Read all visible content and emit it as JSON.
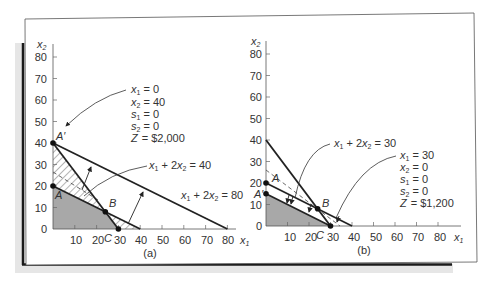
{
  "figure": {
    "colors": {
      "background": "#ffffff",
      "frame": "#555555",
      "shadow_dark": "#1a1a1a",
      "shadow_light": "#e6e6e6",
      "feasible_fill": "#a8a8a8",
      "constraint_line": "#222222"
    }
  },
  "panels": [
    {
      "id": "a",
      "caption": "(a)",
      "x_axis_label": "x",
      "x_axis_sub": "1",
      "y_axis_label": "x",
      "y_axis_sub": "2",
      "x_ticks": [
        "10",
        "20",
        "30",
        "40",
        "50",
        "60",
        "70",
        "80"
      ],
      "y_ticks": [
        "0",
        "10",
        "20",
        "30",
        "40",
        "50",
        "60",
        "70",
        "80"
      ],
      "points": [
        {
          "label": "A'",
          "x": 0,
          "y": 40
        },
        {
          "label": "A",
          "x": 0,
          "y": 20
        },
        {
          "label": "B",
          "x": 24,
          "y": 8
        },
        {
          "label": "C",
          "x": 30,
          "y": 0
        }
      ],
      "line_labels": [
        {
          "text_parts": [
            "x",
            "1",
            " + 2",
            "x",
            "2",
            " = 40"
          ]
        },
        {
          "text_parts": [
            "x",
            "1",
            " + 2",
            "x",
            "2",
            " = 80"
          ]
        }
      ],
      "solution": {
        "x1": "= 0",
        "x2": "= 40",
        "s1": "= 0",
        "s2": "= 0",
        "Z": "= $2,000"
      }
    },
    {
      "id": "b",
      "caption": "(b)",
      "x_axis_label": "x",
      "x_axis_sub": "1",
      "y_axis_label": "x",
      "y_axis_sub": "2",
      "x_ticks": [
        "10",
        "20",
        "30",
        "40",
        "50",
        "60",
        "70",
        "80"
      ],
      "y_ticks": [
        "0",
        "10",
        "20",
        "30",
        "40",
        "50",
        "60",
        "70",
        "80"
      ],
      "points": [
        {
          "label": "A",
          "x": 0,
          "y": 20
        },
        {
          "label": "A'",
          "x": 0,
          "y": 15
        },
        {
          "label": "B",
          "x": 24,
          "y": 8
        },
        {
          "label": "C",
          "x": 30,
          "y": 0
        }
      ],
      "line_labels": [
        {
          "text_parts": [
            "x",
            "1",
            " + 2",
            "x",
            "2",
            " = 30"
          ]
        }
      ],
      "solution": {
        "x1": "= 30",
        "x2": "= 0",
        "s1": "= 0",
        "s2": "= 0",
        "Z": "= $1,200"
      }
    }
  ],
  "labels": {
    "a_x1_sym": "x",
    "a_x1_sub": "1",
    "a_x2_sym": "x",
    "a_x2_sub": "2",
    "b_x1_sym": "x",
    "b_x1_sub": "1",
    "b_x2_sym": "x",
    "b_x2_sub": "2",
    "pt_A_prime": "A′",
    "pt_A": "A",
    "pt_B": "B",
    "pt_C": "C",
    "sol_x": "x",
    "sol_s": "s",
    "sol_Z": "Z",
    "sub1": "1",
    "sub2": "2",
    "plus2": " + 2",
    "eq40": " = 40",
    "eq80": " = 80",
    "eq30": " = 30"
  }
}
